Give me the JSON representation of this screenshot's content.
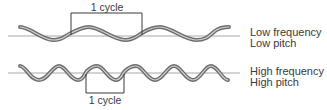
{
  "diagram": {
    "colors": {
      "axis": "#a8a8a8",
      "wave_outer": "#6e6e6e",
      "wave_inner": "#d4d4d4",
      "bracket": "#3a3a3a",
      "text": "#3a3a3a"
    },
    "low_wave": {
      "label_line1": "Low frequency",
      "label_line2": "Low pitch",
      "cycle_label": "1 cycle"
    },
    "high_wave": {
      "label_line1": "High frequency",
      "label_line2": "High pitch",
      "cycle_label": "1 cycle"
    }
  }
}
